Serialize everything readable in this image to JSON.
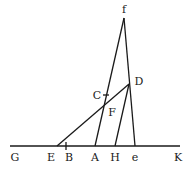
{
  "diagram": {
    "type": "geometric-construction",
    "points": {
      "f": {
        "label": "f",
        "x": 124,
        "y": 18,
        "lx": 124,
        "ly": 13
      },
      "D": {
        "label": "D",
        "x": 129,
        "y": 84,
        "lx": 139,
        "ly": 85
      },
      "C": {
        "label": "C",
        "x": 106,
        "y": 95,
        "lx": 97,
        "ly": 99
      },
      "F": {
        "label": "F",
        "x": 104,
        "y": 104,
        "lx": 112,
        "ly": 116
      },
      "G": {
        "label": "G",
        "x": 15,
        "y": 146,
        "lx": 15,
        "ly": 161
      },
      "E": {
        "label": "E",
        "x": 57,
        "y": 146,
        "lx": 51,
        "ly": 161
      },
      "B": {
        "label": "B",
        "x": 66,
        "y": 146,
        "lx": 69,
        "ly": 161
      },
      "A": {
        "label": "A",
        "x": 95,
        "y": 146,
        "lx": 95,
        "ly": 161
      },
      "H": {
        "label": "H",
        "x": 115,
        "y": 146,
        "lx": 115,
        "ly": 161
      },
      "e": {
        "label": "e",
        "x": 135,
        "y": 146,
        "lx": 135,
        "ly": 161
      },
      "K": {
        "label": "K",
        "x": 177,
        "y": 146,
        "lx": 178,
        "ly": 161
      }
    },
    "segments": [
      [
        "G",
        "K"
      ],
      [
        "f",
        "A"
      ],
      [
        "f",
        "e"
      ],
      [
        "E",
        "D"
      ],
      [
        "D",
        "H"
      ]
    ],
    "ticks": [
      "B",
      "C"
    ]
  }
}
